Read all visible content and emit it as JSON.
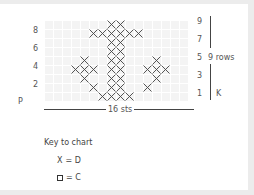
{
  "chart": {
    "stitches_label": "16 sts",
    "rows_label": "9 rows",
    "left_side_label": "P",
    "right_side_label": "K",
    "left_row_numbers": [
      "8",
      "6",
      "4",
      "2"
    ],
    "right_row_numbers": [
      "9",
      "7",
      "5",
      "3",
      "1"
    ],
    "columns": 16,
    "rows": 9,
    "x_cells": [
      {
        "row": 9,
        "cols": [
          7,
          8
        ]
      },
      {
        "row": 8,
        "cols": [
          5,
          6,
          7,
          8,
          9,
          10
        ]
      },
      {
        "row": 7,
        "cols": [
          7,
          8
        ]
      },
      {
        "row": 6,
        "cols": [
          7,
          8
        ]
      },
      {
        "row": 5,
        "cols": [
          4,
          7,
          8,
          12
        ]
      },
      {
        "row": 4,
        "cols": [
          3,
          4,
          5,
          7,
          8,
          11,
          12,
          13
        ]
      },
      {
        "row": 3,
        "cols": [
          4,
          7,
          8,
          12
        ]
      },
      {
        "row": 2,
        "cols": [
          5,
          7,
          8,
          11
        ]
      },
      {
        "row": 1,
        "cols": [
          6,
          7,
          8,
          9
        ]
      }
    ]
  },
  "key": {
    "title": "Key to chart",
    "items": [
      {
        "symbol": "X",
        "label": "= D"
      },
      {
        "symbol": "square",
        "label": "= C"
      }
    ]
  },
  "colors": {
    "grid_fill": "#f4f4f4",
    "stitch": "#444444",
    "text": "#555555"
  }
}
